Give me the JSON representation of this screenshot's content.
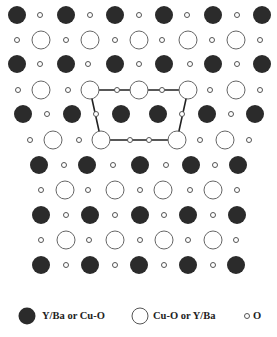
{
  "diagram": {
    "colors": {
      "filled": "#2b2b2b",
      "outline": "#666666",
      "line": "#222222",
      "background": "#ffffff"
    },
    "radii": {
      "large": 9,
      "small": 2.5
    },
    "rows": [
      {
        "y": 15,
        "filled": [
          17,
          66,
          115,
          164,
          213,
          262
        ],
        "open": [],
        "small": [
          40,
          90,
          139,
          187,
          237
        ]
      },
      {
        "y": 40,
        "filled": [],
        "open": [
          41,
          90,
          139,
          188,
          236
        ],
        "small": [
          17,
          66,
          115,
          162,
          212,
          260
        ]
      },
      {
        "y": 64,
        "filled": [
          17,
          66,
          115,
          164,
          213,
          262
        ],
        "open": [],
        "small": [
          40,
          88,
          139,
          190,
          237
        ]
      },
      {
        "y": 90,
        "filled": [],
        "open": [
          41,
          90,
          139,
          188,
          236
        ],
        "small": [
          18,
          68,
          117,
          162,
          210,
          260
        ]
      },
      {
        "y": 114,
        "filled": [
          23,
          72,
          121,
          158,
          207,
          255
        ],
        "open": [],
        "small": [
          47,
          96,
          182,
          231
        ]
      },
      {
        "y": 140,
        "filled": [],
        "open": [
          53,
          101,
          177,
          225
        ],
        "small": [
          30,
          79,
          130,
          149,
          200,
          249
        ]
      },
      {
        "y": 165,
        "filled": [
          39,
          87,
          140,
          191,
          238
        ],
        "open": [],
        "small": [
          64,
          113,
          166,
          215
        ]
      },
      {
        "y": 190,
        "filled": [],
        "open": [
          65,
          115,
          163,
          213
        ],
        "small": [
          41,
          88,
          140,
          190,
          237
        ]
      },
      {
        "y": 215,
        "filled": [
          41,
          90,
          140,
          188,
          237
        ],
        "open": [],
        "small": [
          66,
          115,
          164,
          213
        ]
      },
      {
        "y": 240,
        "filled": [],
        "open": [
          66,
          115,
          164,
          213
        ],
        "small": [
          41,
          89,
          140,
          188,
          236
        ]
      },
      {
        "y": 265,
        "filled": [
          41,
          90,
          139,
          188,
          236
        ],
        "open": [],
        "small": [
          66,
          115,
          164,
          213
        ]
      }
    ],
    "unit_cell_outline": [
      [
        90,
        90
      ],
      [
        188,
        90
      ],
      [
        177,
        140
      ],
      [
        101,
        140
      ]
    ]
  },
  "legend": {
    "items": [
      {
        "symbol": "filled-large-circle",
        "label": "Y/Ba or Cu-O"
      },
      {
        "symbol": "open-large-circle",
        "label": "Cu-O or Y/Ba"
      },
      {
        "symbol": "small-open-circle",
        "label": "O"
      }
    ]
  }
}
